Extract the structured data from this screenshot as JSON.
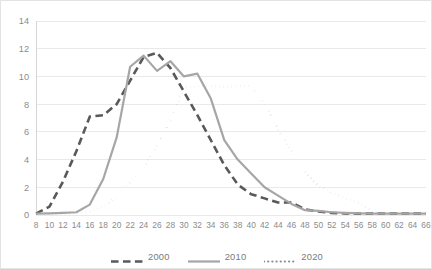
{
  "chart_data": {
    "type": "line",
    "title": "",
    "xlabel": "",
    "ylabel": "",
    "xlim": [
      8,
      66
    ],
    "ylim": [
      0,
      14
    ],
    "grid": "horizontal",
    "legend_position": "bottom",
    "x": [
      8,
      10,
      12,
      14,
      16,
      18,
      20,
      22,
      24,
      26,
      28,
      30,
      32,
      34,
      36,
      38,
      40,
      42,
      44,
      46,
      48,
      50,
      52,
      54,
      56,
      58,
      60,
      62,
      64,
      66
    ],
    "categories": [
      "8",
      "10",
      "12",
      "14",
      "16",
      "18",
      "20",
      "22",
      "24",
      "26",
      "28",
      "30",
      "32",
      "34",
      "36",
      "38",
      "40",
      "42",
      "44",
      "46",
      "48",
      "50",
      "52",
      "54",
      "56",
      "58",
      "60",
      "62",
      "64",
      "66"
    ],
    "ytick_labels": [
      "0",
      "2",
      "4",
      "6",
      "8",
      "10",
      "12",
      "14"
    ],
    "ytick_values": [
      0,
      2,
      4,
      6,
      8,
      10,
      12,
      14
    ],
    "series": [
      {
        "name": "2000",
        "color": "#595959",
        "style": "dashed",
        "width": 2.6,
        "values": [
          0.1,
          0.6,
          2.4,
          4.6,
          7.1,
          7.2,
          8.0,
          9.7,
          11.4,
          11.7,
          10.6,
          8.9,
          7.2,
          5.4,
          3.6,
          2.2,
          1.5,
          1.2,
          0.9,
          0.9,
          0.4,
          0.25,
          0.15,
          0.12,
          0.1,
          0.1,
          0.1,
          0.1,
          0.1,
          0.1
        ]
      },
      {
        "name": "2010",
        "color": "#a6a6a6",
        "style": "solid",
        "width": 2.2,
        "values": [
          0.1,
          0.12,
          0.15,
          0.2,
          0.75,
          2.6,
          5.6,
          10.7,
          11.5,
          10.4,
          11.1,
          10.0,
          10.2,
          8.4,
          5.4,
          4.0,
          3.0,
          2.0,
          1.4,
          0.8,
          0.35,
          0.3,
          0.2,
          0.15,
          0.12,
          0.1,
          0.1,
          0.1,
          0.1,
          0.1
        ]
      },
      {
        "name": "2020",
        "color": "#8c8c8c",
        "style": "dotted",
        "width": 2.2,
        "values": [
          0.05,
          0.06,
          0.08,
          0.12,
          0.22,
          0.6,
          1.3,
          2.3,
          3.4,
          5.0,
          6.8,
          9.2,
          9.3,
          9.3,
          9.25,
          9.3,
          9.3,
          8.0,
          6.2,
          4.6,
          3.1,
          2.1,
          1.6,
          1.2,
          0.9,
          0.25,
          0.12,
          0.1,
          0.1,
          0.1
        ]
      }
    ]
  },
  "legend": {
    "items": [
      {
        "label": "2000"
      },
      {
        "label": "2010"
      },
      {
        "label": "2020"
      }
    ]
  },
  "clipped_header": ""
}
